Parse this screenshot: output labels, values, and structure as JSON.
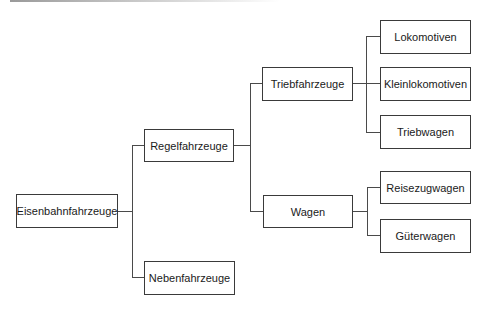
{
  "diagram": {
    "type": "tree",
    "orientation": "left-to-right",
    "root": {
      "label": "Eisenbahnfahrzeuge",
      "children": [
        {
          "label": "Regelfahrzeuge",
          "children": [
            {
              "label": "Triebfahrzeuge",
              "children": [
                {
                  "label": "Lokomotiven"
                },
                {
                  "label": "Kleinlokomotiven"
                },
                {
                  "label": "Triebwagen"
                }
              ]
            },
            {
              "label": "Wagen",
              "children": [
                {
                  "label": "Reisezugwagen"
                },
                {
                  "label": "Güterwagen"
                }
              ]
            }
          ]
        },
        {
          "label": "Nebenfahrzeuge"
        }
      ]
    }
  },
  "nodes": {
    "eisenbahnfahrzeuge": "Eisenbahnfahrzeuge",
    "regelfahrzeuge": "Regelfahrzeuge",
    "nebenfahrzeuge": "Nebenfahrzeuge",
    "triebfahrzeuge": "Triebfahrzeuge",
    "wagen": "Wagen",
    "lokomotiven": "Lokomotiven",
    "kleinlokomotiven": "Kleinlokomotiven",
    "triebwagen": "Triebwagen",
    "reisezugwagen": "Reisezugwagen",
    "gueterwagen": "Güterwagen"
  },
  "colors": {
    "border": "#3a3a3a",
    "line": "#4a4a4a",
    "background": "#ffffff",
    "text": "#1a1a1a"
  }
}
